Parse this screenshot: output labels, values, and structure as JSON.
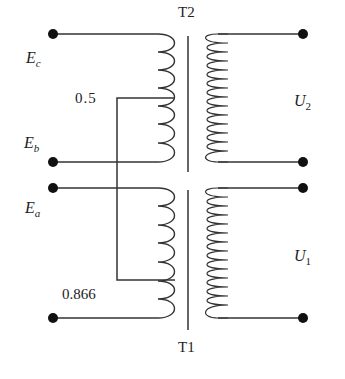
{
  "diagram": {
    "type": "transformer-circuit",
    "transformers": [
      {
        "id": "T2",
        "label": "T2",
        "position": "top"
      },
      {
        "id": "T1",
        "label": "T1",
        "position": "bottom"
      }
    ],
    "inputs": {
      "Ec": {
        "base": "E",
        "sub": "c"
      },
      "Eb": {
        "base": "E",
        "sub": "b"
      },
      "Ea": {
        "base": "E",
        "sub": "a"
      }
    },
    "outputs": {
      "U2": {
        "base": "U",
        "sub": "2"
      },
      "U1": {
        "base": "U",
        "sub": "1"
      }
    },
    "taps": {
      "t2_tap": "0.5",
      "t1_tap": "0.866"
    },
    "colors": {
      "line": "#333333",
      "terminal": "#111111",
      "background": "#ffffff"
    }
  }
}
